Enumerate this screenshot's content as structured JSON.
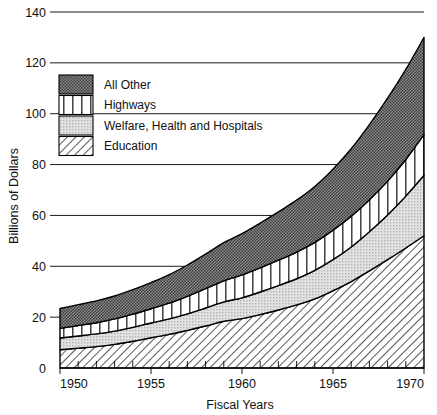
{
  "chart_data": {
    "type": "area",
    "stacked": true,
    "title": "",
    "xlabel": "Fiscal Years",
    "ylabel": "Billions of Dollars",
    "xlim": [
      1950,
      1970
    ],
    "ylim": [
      0,
      140
    ],
    "ytick_labels": [
      "0",
      "20",
      "40",
      "60",
      "80",
      "100",
      "120",
      "140"
    ],
    "yticks": [
      0,
      20,
      40,
      60,
      80,
      100,
      120,
      140
    ],
    "xtick_labels": [
      "1950",
      "1955",
      "1960",
      "1965",
      "1970"
    ],
    "xticks": [
      1950,
      1955,
      1960,
      1965,
      1970
    ],
    "minor_xticks": [
      1951,
      1952,
      1953,
      1954,
      1956,
      1957,
      1958,
      1959,
      1961,
      1962,
      1963,
      1964,
      1966,
      1967,
      1968,
      1969
    ],
    "grid": "horizontal",
    "legend_position": "upper-left-inside",
    "x": [
      1950,
      1951,
      1952,
      1953,
      1954,
      1955,
      1956,
      1957,
      1958,
      1959,
      1960,
      1961,
      1962,
      1963,
      1964,
      1965,
      1966,
      1967,
      1968,
      1969,
      1970
    ],
    "series": [
      {
        "name": "Education",
        "pattern": "diagonal-hatch",
        "color": "#ffffff",
        "values": [
          7.2,
          7.8,
          8.4,
          9.3,
          10.5,
          11.9,
          13.2,
          14.8,
          16.5,
          18.4,
          19.4,
          21.0,
          22.8,
          24.8,
          27.2,
          30.4,
          34.0,
          38.2,
          42.6,
          47.2,
          52.0
        ]
      },
      {
        "name": "Welfare, Health and Hospitals",
        "pattern": "light-dots",
        "color": "#d9d9d9",
        "values": [
          4.6,
          4.8,
          5.0,
          5.2,
          5.5,
          5.8,
          6.1,
          6.5,
          7.1,
          7.6,
          8.2,
          8.9,
          9.6,
          10.3,
          11.2,
          12.2,
          13.6,
          15.4,
          17.6,
          20.4,
          23.8
        ]
      },
      {
        "name": "Highways",
        "pattern": "vertical-stripes",
        "color": "#ffffff",
        "values": [
          3.8,
          4.1,
          4.4,
          4.8,
          5.2,
          5.6,
          6.2,
          6.9,
          7.6,
          8.3,
          9.0,
          9.5,
          10.0,
          10.5,
          11.0,
          11.6,
          12.1,
          12.6,
          13.3,
          14.4,
          16.0
        ]
      },
      {
        "name": "All Other",
        "pattern": "dark-check",
        "color": "#5f5f5f",
        "values": [
          7.8,
          8.2,
          8.6,
          9.0,
          9.6,
          10.3,
          11.2,
          12.3,
          13.6,
          15.0,
          16.2,
          17.6,
          19.0,
          20.4,
          22.0,
          24.0,
          26.5,
          29.5,
          32.6,
          35.4,
          38.2
        ]
      }
    ],
    "totals": [
      23.4,
      24.9,
      26.4,
      28.3,
      30.8,
      33.6,
      36.7,
      40.5,
      44.8,
      49.3,
      52.8,
      57.0,
      61.4,
      66.0,
      71.4,
      78.2,
      86.2,
      95.7,
      106.1,
      117.4,
      130.0
    ]
  },
  "legend": {
    "items": [
      {
        "label": "All Other",
        "key": "all-other"
      },
      {
        "label": "Highways",
        "key": "highways"
      },
      {
        "label": "Welfare, Health and Hospitals",
        "key": "welfare-health-hospitals"
      },
      {
        "label": "Education",
        "key": "education"
      }
    ]
  }
}
